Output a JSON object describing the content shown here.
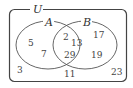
{
  "diagram": {
    "type": "venn",
    "universe_label": "U",
    "sets": [
      {
        "label": "A"
      },
      {
        "label": "B"
      }
    ],
    "regions": {
      "a_only": [
        "5",
        "7"
      ],
      "a_and_b": [
        "2",
        "13",
        "29"
      ],
      "b_only": [
        "17",
        "19"
      ],
      "outside": [
        "3",
        "11",
        "23"
      ]
    },
    "colors": {
      "stroke": "#444444",
      "text": "#333333",
      "background": "#ffffff"
    }
  }
}
